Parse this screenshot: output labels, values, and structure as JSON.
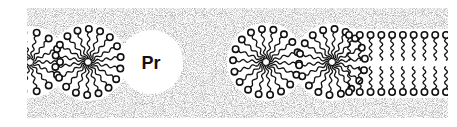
{
  "figure": {
    "band": {
      "x": 27,
      "y": 8,
      "width": 421,
      "height": 110,
      "color": "#9a9a9a"
    },
    "protein": {
      "label": "Pr",
      "cx": 151,
      "cy": 62,
      "r": 32
    },
    "micelles": [
      {
        "cx": 30,
        "cy": 62,
        "r": 34,
        "heads": 14
      },
      {
        "cx": 88,
        "cy": 62,
        "r": 37,
        "heads": 18
      },
      {
        "cx": 266,
        "cy": 62,
        "r": 37,
        "heads": 18
      },
      {
        "cx": 332,
        "cy": 62,
        "r": 37,
        "heads": 18
      }
    ],
    "bilayer": {
      "x_start": 345,
      "x_end": 446,
      "count": 10,
      "top_y": 35,
      "bottom_y": 92
    },
    "colors": {
      "ink": "#111111",
      "background": "#ffffff",
      "stipple": "#8c8c8c"
    }
  }
}
